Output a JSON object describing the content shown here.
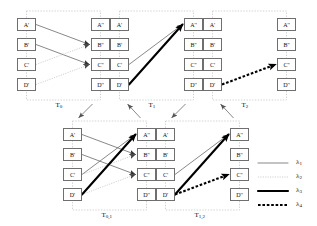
{
  "figure": {
    "title": "",
    "node_labels": {
      "left": [
        "A'",
        "B'",
        "C'",
        "D'"
      ],
      "right": [
        "A''",
        "B''",
        "C''",
        "D''"
      ]
    }
  },
  "groups": [
    {
      "id": "T0",
      "label_main": "T",
      "label_sub": "0",
      "x": 17,
      "y": 11,
      "nodes_left": [
        "A'",
        "B'",
        "C'",
        "D'"
      ],
      "nodes_right": [
        "A''",
        "B''",
        "C''",
        "D''"
      ]
    },
    {
      "id": "T1",
      "label_main": "T",
      "label_sub": "1",
      "x": 110,
      "y": 11,
      "nodes_left": [
        "A'",
        "B'",
        "C'",
        "D'"
      ],
      "nodes_right": [
        "A''",
        "B''",
        "C''",
        "D''"
      ]
    },
    {
      "id": "T2",
      "label_main": "T",
      "label_sub": "2",
      "x": 203,
      "y": 11,
      "nodes_left": [
        "A'",
        "B'",
        "C'",
        "D'"
      ],
      "nodes_right": [
        "A''",
        "B''",
        "C''",
        "D''"
      ]
    },
    {
      "id": "T01",
      "label_main": "T",
      "label_sub": "0,1",
      "x": 63,
      "y": 121,
      "nodes_left": [
        "A'",
        "B'",
        "C'",
        "D'"
      ],
      "nodes_right": [
        "A''",
        "B''",
        "C''",
        "D''"
      ]
    },
    {
      "id": "T12",
      "label_main": "T",
      "label_sub": "1,2",
      "x": 156,
      "y": 121,
      "nodes_left": [
        "A'",
        "B'",
        "C'",
        "D'"
      ],
      "nodes_right": [
        "A''",
        "B''",
        "C''",
        "D''"
      ]
    }
  ],
  "edges": {
    "T0": [
      {
        "from": "A'",
        "to": "B''",
        "style": "lambda1"
      },
      {
        "from": "B'",
        "to": "C''",
        "style": "lambda1"
      },
      {
        "from": "C'",
        "to": "B''",
        "style": "lambda2"
      },
      {
        "from": "D'",
        "to": "C''",
        "style": "lambda2"
      }
    ],
    "T1": [
      {
        "from": "C'",
        "to": "A''",
        "style": "lambda1"
      },
      {
        "from": "D'",
        "to": "A''",
        "style": "lambda3"
      }
    ],
    "T2": [
      {
        "from": "D'",
        "to": "C''",
        "style": "lambda4"
      }
    ],
    "T01": [
      {
        "from": "A'",
        "to": "B''",
        "style": "lambda1"
      },
      {
        "from": "B'",
        "to": "C''",
        "style": "lambda1"
      },
      {
        "from": "C'",
        "to": "A''",
        "style": "lambda1"
      },
      {
        "from": "C'",
        "to": "B''",
        "style": "lambda2"
      },
      {
        "from": "D'",
        "to": "C''",
        "style": "lambda2"
      },
      {
        "from": "D'",
        "to": "A''",
        "style": "lambda3"
      }
    ],
    "T12": [
      {
        "from": "C'",
        "to": "A''",
        "style": "lambda1"
      },
      {
        "from": "D'",
        "to": "A''",
        "style": "lambda3"
      },
      {
        "from": "D'",
        "to": "C''",
        "style": "lambda4"
      }
    ]
  },
  "connectors": [
    {
      "from": "T0",
      "to": "T01"
    },
    {
      "from": "T01",
      "to": "T1"
    },
    {
      "from": "T1",
      "to": "T12"
    },
    {
      "from": "T12",
      "to": "T2"
    }
  ],
  "legend": {
    "items": [
      {
        "key": "lambda1",
        "main": "λ",
        "sub": "1",
        "sample": "thin-solid"
      },
      {
        "key": "lambda2",
        "main": "λ",
        "sub": "2",
        "sample": "light-dotted"
      },
      {
        "key": "lambda3",
        "main": "λ",
        "sub": "3",
        "sample": "thick-solid"
      },
      {
        "key": "lambda4",
        "main": "λ",
        "sub": "4",
        "sample": "thick-dashed"
      }
    ]
  },
  "colors": {
    "line_lambda1": "#555555",
    "line_lambda2": "#bdbdbd",
    "line_lambda3": "#000000",
    "line_lambda4": "#000000",
    "node_border": "#6f6f6f",
    "group_border": "#c8c8c8",
    "connector": "#6a6a6a",
    "background": "#ffffff"
  }
}
